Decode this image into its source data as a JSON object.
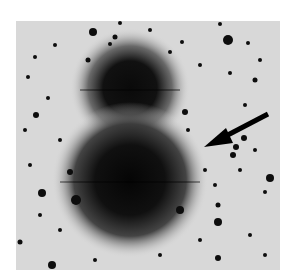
{
  "image": {
    "description": "Negative (inverted) astronomical photograph of a star field with two overlapping diffuse dark halos (bright objects) and an arrow pointing to a faint object",
    "background_color": "#d8d8d8",
    "foreground_color": "#111111",
    "arrow": {
      "tail": [
        268,
        113
      ],
      "tip": [
        205,
        147
      ]
    }
  }
}
